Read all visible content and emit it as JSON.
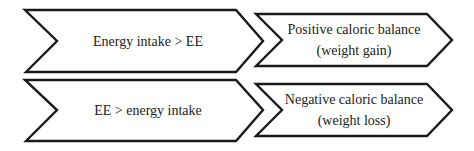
{
  "diagram": {
    "rows": [
      {
        "condition": {
          "lines": [
            "Energy intake > EE"
          ]
        },
        "outcome": {
          "lines": [
            "Positive caloric balance",
            "(weight gain)"
          ]
        }
      },
      {
        "condition": {
          "lines": [
            "EE > energy intake"
          ]
        },
        "outcome": {
          "lines": [
            "Negative caloric balance",
            "(weight loss)"
          ]
        }
      }
    ],
    "colors": {
      "stroke": "#1a1a1a",
      "fill": "#ffffff",
      "text": "#222222"
    }
  }
}
